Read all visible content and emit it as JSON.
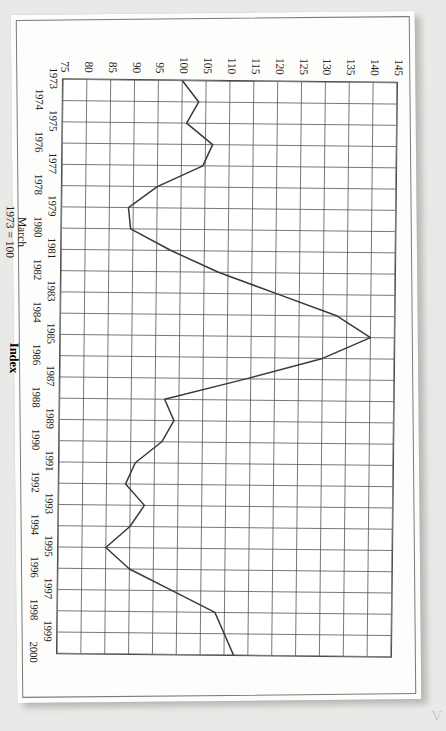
{
  "page": {
    "corner_mark": "V"
  },
  "chart_data": {
    "type": "line",
    "title": "",
    "xlabel": "",
    "ylabel": "Index",
    "base_note": "March\n1973 = 100",
    "grid": true,
    "legend": "none",
    "xlim": [
      1973,
      2000
    ],
    "ylim": [
      75,
      145
    ],
    "ytick_step": 5,
    "ytick_labels": [
      "145",
      "140",
      "135",
      "130",
      "125",
      "120",
      "115",
      "110",
      "105",
      "100",
      "95",
      "90",
      "85",
      "80",
      "75"
    ],
    "xtick_labels": [
      "1973",
      "1974",
      "1975",
      "1976",
      "1977",
      "1978",
      "1979",
      "1980",
      "1981",
      "1982",
      "1983",
      "1984",
      "1985",
      "1986",
      "1987",
      "1988",
      "1989",
      "1990",
      "1991",
      "1992",
      "1993",
      "1994",
      "1995",
      "1996",
      "1997",
      "1998",
      "1999",
      "2000"
    ],
    "x": [
      1973,
      1974,
      1975,
      1976,
      1977,
      1978,
      1979,
      1980,
      1981,
      1982,
      1983,
      1984,
      1985,
      1986,
      1987,
      1988,
      1989,
      1990,
      1991,
      1992,
      1993,
      1994,
      1995,
      1996,
      1997,
      1998,
      1999,
      2000
    ],
    "values": [
      100,
      103.5,
      101,
      106.5,
      104.5,
      95,
      89,
      89.5,
      98,
      108,
      120.5,
      133,
      140,
      130,
      114,
      97,
      99,
      96.5,
      91,
      89,
      93,
      90,
      85,
      90,
      99,
      108,
      110,
      112
    ],
    "series": [
      {
        "name": "Index",
        "color": "#3a3a3a",
        "values": [
          100,
          103.5,
          101,
          106.5,
          104.5,
          95,
          89,
          89.5,
          98,
          108,
          120.5,
          133,
          140,
          130,
          114,
          97,
          99,
          96.5,
          91,
          89,
          93,
          90,
          85,
          90,
          99,
          108,
          110,
          112
        ]
      }
    ]
  }
}
